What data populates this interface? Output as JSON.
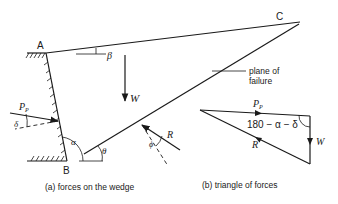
{
  "figure_a": {
    "caption": "(a) forces on the wedge",
    "points": {
      "A": "A",
      "B": "B",
      "C": "C"
    },
    "angles": {
      "beta": "β",
      "alpha": "α",
      "theta": "θ",
      "delta": "δ",
      "phi": "ϕ"
    },
    "forces": {
      "W": "W",
      "P": "P",
      "P_sub": "P",
      "R": "R"
    },
    "annotation": {
      "line1": "plane of",
      "line2": "failure"
    }
  },
  "figure_b": {
    "caption": "(b) triangle of forces",
    "forces": {
      "P": "P",
      "P_sub": "P",
      "W": "W",
      "R": "R"
    },
    "angle_label": "180 − α − δ"
  }
}
